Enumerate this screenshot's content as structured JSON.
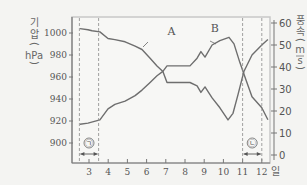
{
  "chart_data": {
    "type": "line",
    "title": "",
    "xlabel": "일",
    "ylabel_left": "기압 (hPa)",
    "ylabel_left_chars": [
      "기",
      "압",
      "(",
      "hPa",
      ")"
    ],
    "ylabel_right": "풍속 (m/s)",
    "ylabel_right_chars": [
      "풍",
      "속",
      "(",
      "m",
      "s",
      ")"
    ],
    "x_ticks": [
      3,
      4,
      5,
      6,
      7,
      8,
      9,
      10,
      11,
      12
    ],
    "x_tick_labels": [
      "3",
      "4",
      "5",
      "6",
      "7",
      "8",
      "9",
      "10",
      "11",
      "12"
    ],
    "x_unit_label": "일",
    "xlim": [
      2.1,
      12.5
    ],
    "y_left_ticks": [
      900,
      920,
      940,
      960,
      980,
      1000
    ],
    "y_left_tick_labels": [
      "900",
      "920",
      "940",
      "960",
      "980",
      "1000"
    ],
    "ylim_left": [
      888,
      1015
    ],
    "y_right_ticks": [
      0,
      10,
      20,
      30,
      40,
      50,
      60
    ],
    "y_right_tick_labels": [
      "0",
      "10",
      "20",
      "30",
      "40",
      "50",
      "60"
    ],
    "ylim_right": [
      0,
      65
    ],
    "grid": false,
    "series": [
      {
        "name": "A",
        "axis": "left",
        "quantity": "기압 (hPa)",
        "x": [
          2.53,
          2.95,
          3.16,
          3.57,
          3.99,
          4.35,
          4.88,
          5.4,
          5.76,
          6.18,
          6.54,
          6.85,
          7.06,
          7.48,
          8.26,
          8.63,
          8.83,
          9.04,
          9.41,
          9.82,
          10.24,
          10.5,
          10.76,
          11.07,
          11.49,
          12.0,
          12.32
        ],
        "values": [
          1004,
          1003,
          1002,
          1001,
          995,
          994,
          992,
          988,
          985,
          977,
          970,
          965,
          955,
          955,
          955,
          952,
          946,
          951,
          941,
          932,
          921,
          927,
          944,
          965,
          980,
          989,
          994
        ],
        "label_at": {
          "x": 7.3,
          "y": 998
        }
      },
      {
        "name": "B",
        "axis": "right",
        "quantity": "풍속 (m/s)",
        "x": [
          2.53,
          2.95,
          3.57,
          3.99,
          4.35,
          4.88,
          5.4,
          5.76,
          6.18,
          6.54,
          6.85,
          7.06,
          8.26,
          8.63,
          8.83,
          9.04,
          9.41,
          9.82,
          10.29,
          10.55,
          10.86,
          11.18,
          11.49,
          12.0,
          12.32
        ],
        "values": [
          14,
          14.5,
          16,
          21,
          23,
          24.5,
          27,
          29.5,
          33,
          36,
          38,
          40.5,
          40.5,
          44,
          47,
          44.5,
          50,
          52,
          53.5,
          50.5,
          42,
          34,
          26.5,
          21.5,
          16
        ],
        "label_at": {
          "x": 9.55,
          "y": 56
        }
      }
    ],
    "annotations": [
      {
        "label": "㉠",
        "x_start": 2.5,
        "x_end": 3.5,
        "style": "dashed-bracket"
      },
      {
        "label": "㉡",
        "x_start": 11.0,
        "x_end": 12.0,
        "style": "dashed-bracket"
      }
    ],
    "colors": {
      "line": "#6e6e6e",
      "axis": "#777777",
      "dashed": "#8a8a8a",
      "background": "#f4f4f2",
      "plot_border": "#c8c8c8"
    }
  }
}
